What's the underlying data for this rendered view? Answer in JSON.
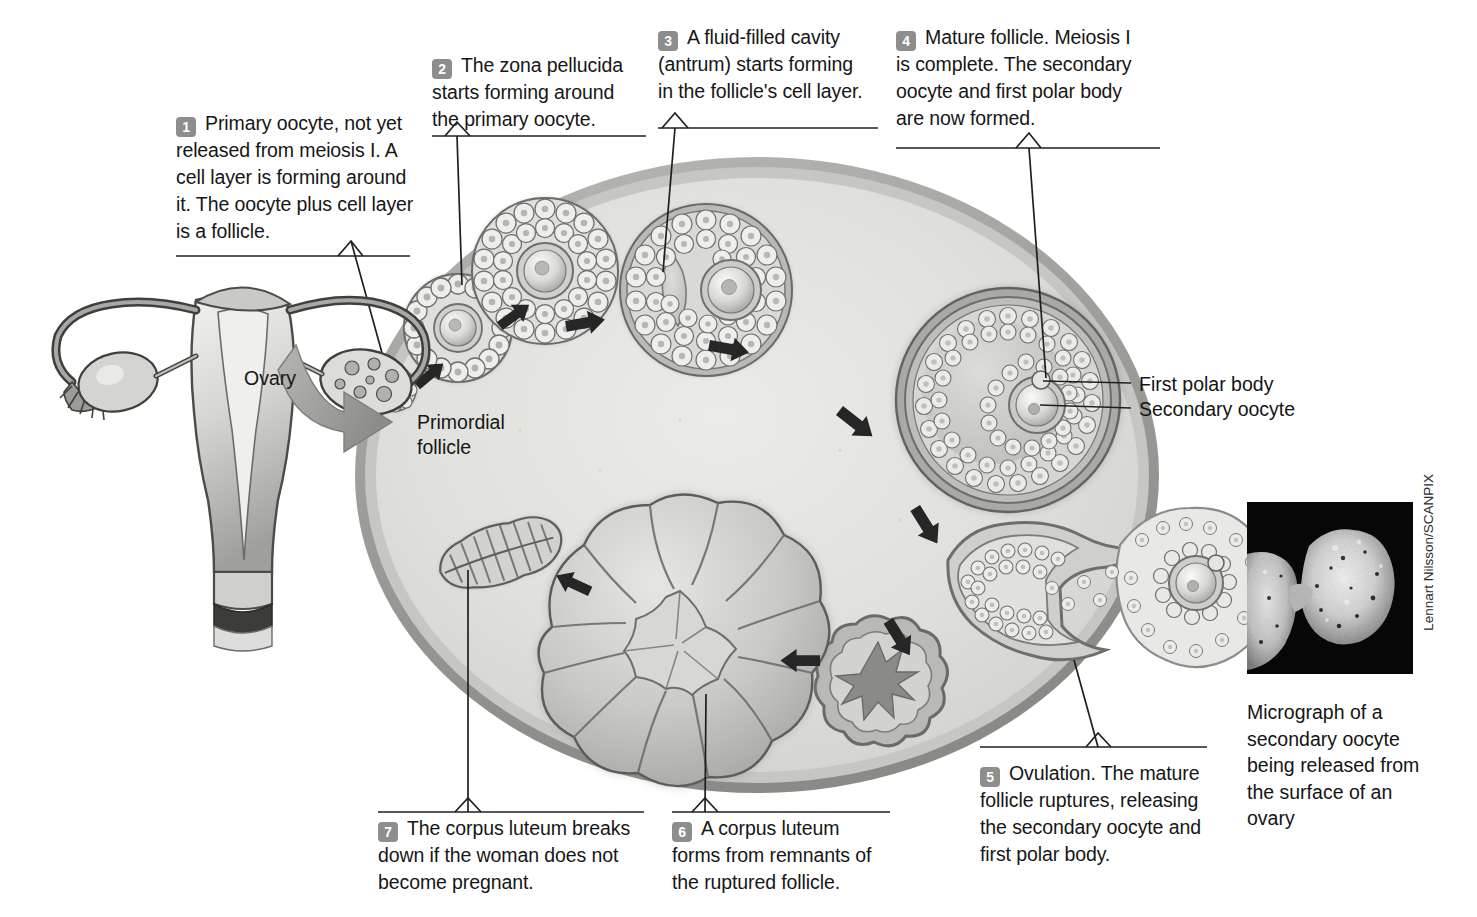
{
  "figure": {
    "title": "Ovarian cycle: follicle development, ovulation and corpus luteum",
    "organ_label": "Ovary",
    "primordial_label_line1": "Primordial",
    "primordial_label_line2": "follicle"
  },
  "callouts": [
    {
      "number": "1",
      "text": "Primary oocyte, not yet released from meiosis I. A cell layer is forming around it. The oocyte plus cell layer is a follicle."
    },
    {
      "number": "2",
      "text": "The zona pellucida starts forming around the primary oocyte."
    },
    {
      "number": "3",
      "text": "A fluid-filled cavity (antrum) starts forming in the follicle's cell layer."
    },
    {
      "number": "4",
      "text": "Mature follicle. Meiosis I is complete. The secondary oocyte and first polar body are now formed."
    },
    {
      "number": "5",
      "text": "Ovulation. The mature follicle ruptures, releasing the secondary oocyte and first polar body."
    },
    {
      "number": "6",
      "text": "A corpus luteum forms from remnants of the ruptured follicle."
    },
    {
      "number": "7",
      "text": "The corpus luteum breaks down if the woman does not become pregnant."
    }
  ],
  "leader_labels": [
    {
      "text": "First polar body"
    },
    {
      "text": "Secondary oocyte"
    }
  ],
  "micrograph": {
    "caption": "Micrograph of a secondary oocyte being released from the surface of an ovary",
    "credit": "Lennart Nilsson/SCANPIX"
  },
  "colors": {
    "badge_grey": "#8d8d8d",
    "text_black": "#161616",
    "ovary_stroma": "#d9d9d5",
    "ovary_cortex": "#b4b4b0",
    "ovary_capsule": "#9a9a96",
    "follicle_cells": "#e3e3e0",
    "follicle_outline": "#6f6f6c",
    "antrum": "#c4c4c1",
    "corpus_luteum": "#c8c8c4",
    "page_background": "#ffffff",
    "micrograph_background": "#000000"
  }
}
